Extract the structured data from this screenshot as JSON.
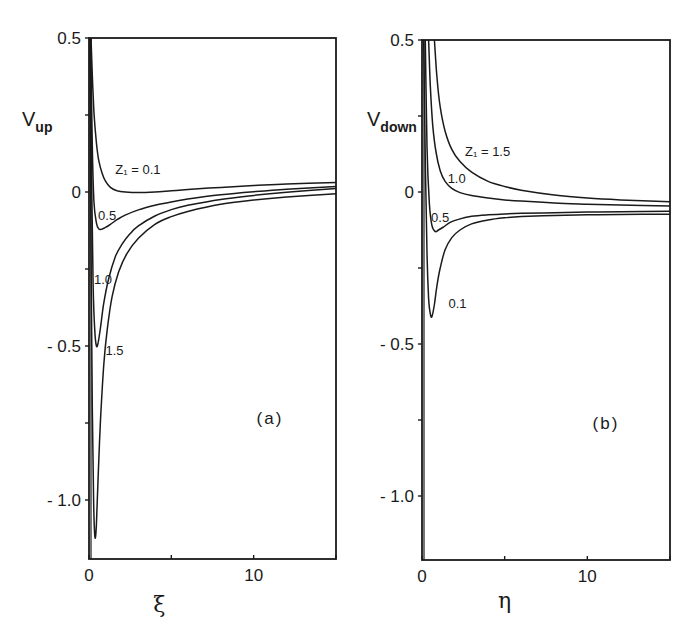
{
  "chart_data": [
    {
      "type": "line",
      "panel_tag": "(a)",
      "ylabel_main": "V",
      "ylabel_sub": "up",
      "xlabel": "ξ",
      "xlim": [
        0,
        15
      ],
      "ylim": [
        -1.19,
        0.5
      ],
      "xticks": [
        0,
        5,
        10,
        15
      ],
      "xtick_labels": [
        "0",
        "",
        "10",
        ""
      ],
      "yticks": [
        0.5,
        0.25,
        0,
        -0.25,
        -0.5,
        -0.75,
        -1.0
      ],
      "ytick_labels": [
        "0.5",
        "",
        "0",
        "",
        "- 0.5",
        "",
        "- 1.0"
      ],
      "grid": false,
      "legend_title": "Z1",
      "series": [
        {
          "name": "Z1 = 0.1",
          "label": "Z₁ = 0.1",
          "label_pos": [
            1.6,
            0.06
          ],
          "x": [
            0.12,
            0.2,
            0.3,
            0.45,
            0.6,
            0.8,
            1.0,
            1.3,
            1.7,
            2.2,
            3,
            4,
            5,
            6,
            8,
            10,
            12,
            15
          ],
          "y": [
            0.5,
            0.38,
            0.26,
            0.16,
            0.1,
            0.06,
            0.035,
            0.015,
            0.004,
            0.0,
            -0.002,
            0.0,
            0.004,
            0.008,
            0.015,
            0.021,
            0.026,
            0.031
          ]
        },
        {
          "name": "Z1 = 0.5",
          "label": "0.5",
          "label_pos": [
            0.55,
            -0.09
          ],
          "x": [
            0.1,
            0.2,
            0.3,
            0.45,
            0.6,
            0.8,
            1.0,
            1.3,
            1.7,
            2.2,
            3,
            4,
            5,
            6,
            8,
            10,
            12,
            15
          ],
          "y": [
            0.5,
            0.15,
            -0.03,
            -0.1,
            -0.12,
            -0.12,
            -0.115,
            -0.105,
            -0.09,
            -0.075,
            -0.058,
            -0.043,
            -0.032,
            -0.023,
            -0.009,
            0.001,
            0.009,
            0.018
          ]
        },
        {
          "name": "Z1 = 1.0",
          "label": "1.0",
          "label_pos": [
            0.3,
            -0.3
          ],
          "x": [
            0.08,
            0.15,
            0.25,
            0.35,
            0.45,
            0.55,
            0.7,
            0.9,
            1.2,
            1.6,
            2.0,
            2.5,
            3,
            4,
            5,
            6,
            8,
            10,
            12,
            15
          ],
          "y": [
            0.5,
            0.1,
            -0.3,
            -0.45,
            -0.5,
            -0.49,
            -0.44,
            -0.36,
            -0.28,
            -0.21,
            -0.17,
            -0.135,
            -0.11,
            -0.078,
            -0.057,
            -0.043,
            -0.024,
            -0.011,
            -0.001,
            0.011
          ]
        },
        {
          "name": "Z1 = 1.5",
          "label": "1.5",
          "label_pos": [
            1.0,
            -0.53
          ],
          "x": [
            0.06,
            0.12,
            0.2,
            0.28,
            0.36,
            0.45,
            0.55,
            0.7,
            0.9,
            1.1,
            1.4,
            1.8,
            2.3,
            3,
            4,
            5,
            6,
            8,
            10,
            12,
            15
          ],
          "y": [
            0.5,
            -0.2,
            -0.7,
            -1.0,
            -1.12,
            -1.08,
            -0.93,
            -0.74,
            -0.56,
            -0.45,
            -0.34,
            -0.26,
            -0.2,
            -0.15,
            -0.105,
            -0.08,
            -0.063,
            -0.04,
            -0.026,
            -0.016,
            -0.006
          ]
        }
      ]
    },
    {
      "type": "line",
      "panel_tag": "(b)",
      "ylabel_main": "V",
      "ylabel_sub": "down",
      "xlabel": "η",
      "xlim": [
        0,
        15
      ],
      "ylim": [
        -1.19,
        0.5
      ],
      "xticks": [
        0,
        5,
        10,
        15
      ],
      "xtick_labels": [
        "0",
        "",
        "10",
        ""
      ],
      "yticks": [
        0.5,
        0.25,
        0,
        -0.25,
        -0.5,
        -0.75,
        -1.0
      ],
      "ytick_labels": [
        "0.5",
        "",
        "0",
        "",
        "- 0.5",
        "",
        "- 1.0"
      ],
      "grid": false,
      "legend_title": "Z1",
      "series": [
        {
          "name": "Z1 = 1.5",
          "label": "Z₁ = 1.5",
          "label_pos": [
            2.6,
            0.12
          ],
          "x": [
            0.75,
            0.9,
            1.1,
            1.4,
            1.8,
            2.3,
            3,
            4,
            5,
            6,
            8,
            10,
            12,
            15
          ],
          "y": [
            0.5,
            0.38,
            0.28,
            0.2,
            0.14,
            0.1,
            0.065,
            0.035,
            0.018,
            0.006,
            -0.01,
            -0.02,
            -0.026,
            -0.032
          ]
        },
        {
          "name": "Z1 = 1.0",
          "label": "1.0",
          "label_pos": [
            1.55,
            0.03
          ],
          "x": [
            0.4,
            0.5,
            0.65,
            0.85,
            1.1,
            1.4,
            1.8,
            2.3,
            3,
            4,
            5,
            6,
            8,
            10,
            12,
            15
          ],
          "y": [
            0.5,
            0.35,
            0.22,
            0.13,
            0.07,
            0.035,
            0.012,
            -0.002,
            -0.012,
            -0.02,
            -0.026,
            -0.03,
            -0.036,
            -0.04,
            -0.043,
            -0.046
          ]
        },
        {
          "name": "Z1 = 0.5",
          "label": "0.5",
          "label_pos": [
            0.55,
            -0.1
          ],
          "x": [
            0.2,
            0.3,
            0.45,
            0.6,
            0.8,
            1.0,
            1.3,
            1.7,
            2.2,
            3,
            4,
            5,
            6,
            8,
            10,
            12,
            15
          ],
          "y": [
            0.5,
            0.15,
            -0.04,
            -0.11,
            -0.13,
            -0.125,
            -0.115,
            -0.1,
            -0.09,
            -0.08,
            -0.075,
            -0.072,
            -0.07,
            -0.068,
            -0.066,
            -0.065,
            -0.063
          ]
        },
        {
          "name": "Z1 = 0.1",
          "label": "0.1",
          "label_pos": [
            1.6,
            -0.38
          ],
          "x": [
            0.1,
            0.2,
            0.3,
            0.4,
            0.5,
            0.6,
            0.75,
            0.9,
            1.1,
            1.4,
            1.8,
            2.3,
            3,
            4,
            5,
            6,
            8,
            10,
            12,
            15
          ],
          "y": [
            0.5,
            0.1,
            -0.2,
            -0.35,
            -0.4,
            -0.41,
            -0.37,
            -0.31,
            -0.25,
            -0.19,
            -0.15,
            -0.125,
            -0.105,
            -0.092,
            -0.085,
            -0.081,
            -0.077,
            -0.075,
            -0.074,
            -0.073
          ]
        }
      ]
    }
  ],
  "panels": [
    {
      "tag": "(a)",
      "y_label_main": "V",
      "y_label_sub": "up",
      "x_label": "ξ"
    },
    {
      "tag": "(b)",
      "y_label_main": "V",
      "y_label_sub": "down",
      "x_label": "η"
    }
  ]
}
